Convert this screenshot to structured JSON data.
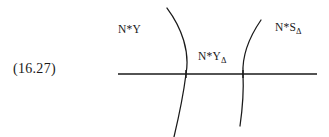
{
  "figure": {
    "equation_number": "(16.27)",
    "background_color": "#ffffff",
    "stroke_color": "#1a1a1a",
    "labels": {
      "left": {
        "base": "N*Y",
        "subscript": ""
      },
      "middle": {
        "base": "N*Y",
        "subscript": "Δ"
      },
      "right": {
        "base": "N*S",
        "subscript": "Δ"
      }
    },
    "geometry": {
      "horizontal_axis": {
        "x_start": 118,
        "x_end": 317,
        "y": 74
      },
      "left_curve": {
        "top": [
          167,
          8
        ],
        "crossing": [
          186,
          74
        ],
        "bottom": [
          174,
          137
        ],
        "bulge": "right"
      },
      "right_curve": {
        "top": [
          261,
          20
        ],
        "crossing": [
          243,
          74
        ],
        "bottom": [
          240,
          126
        ],
        "bulge": "left"
      },
      "intersection_ticks": [
        [
          186,
          74
        ],
        [
          243,
          74
        ]
      ]
    }
  }
}
